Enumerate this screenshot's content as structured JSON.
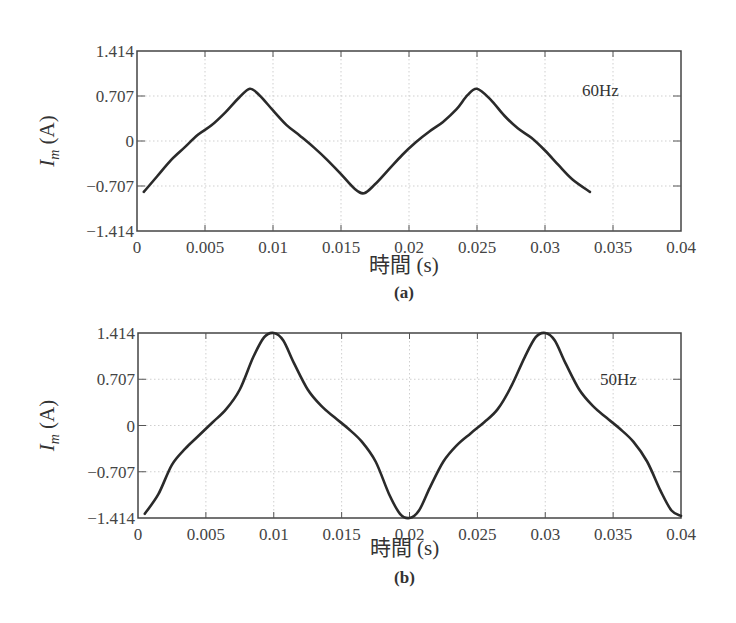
{
  "chart_data": [
    {
      "type": "line",
      "panel": "(a)",
      "annotation": "60Hz",
      "xlabel": "時間 (s)",
      "ylabel": "I_m (A)",
      "xlim": [
        0,
        0.04
      ],
      "ylim": [
        -1.414,
        1.414
      ],
      "xticks": [
        "0",
        "0.005",
        "0.01",
        "0.015",
        "0.02",
        "0.025",
        "0.03",
        "0.035",
        "0.04"
      ],
      "yticks": [
        "1.414",
        "0.707",
        "0",
        "-0.707",
        "-1.414"
      ],
      "grid": true,
      "series": [
        {
          "name": "I_m 60Hz",
          "x": [
            0.0005,
            0.0015,
            0.0025,
            0.0035,
            0.0045,
            0.0055,
            0.0065,
            0.0075,
            0.0083,
            0.009,
            0.01,
            0.011,
            0.012,
            0.013,
            0.014,
            0.015,
            0.016,
            0.0167,
            0.0175,
            0.0185,
            0.0195,
            0.0205,
            0.0215,
            0.0225,
            0.0235,
            0.0243,
            0.025,
            0.026,
            0.027,
            0.028,
            0.029,
            0.03,
            0.031,
            0.032,
            0.0333
          ],
          "y": [
            -0.8,
            -0.55,
            -0.3,
            -0.1,
            0.1,
            0.25,
            0.45,
            0.68,
            0.82,
            0.72,
            0.48,
            0.25,
            0.08,
            -0.1,
            -0.3,
            -0.52,
            -0.75,
            -0.82,
            -0.68,
            -0.45,
            -0.22,
            -0.02,
            0.15,
            0.3,
            0.5,
            0.72,
            0.82,
            0.65,
            0.4,
            0.2,
            0.05,
            -0.15,
            -0.38,
            -0.6,
            -0.8
          ]
        }
      ]
    },
    {
      "type": "line",
      "panel": "(b)",
      "annotation": "50Hz",
      "xlabel": "時間 (s)",
      "ylabel": "I_m (A)",
      "xlim": [
        0,
        0.04
      ],
      "ylim": [
        -1.414,
        1.414
      ],
      "xticks": [
        "0",
        "0.005",
        "0.01",
        "0.015",
        "0.02",
        "0.025",
        "0.03",
        "0.035",
        "0.04"
      ],
      "yticks": [
        "1.414",
        "0.707",
        "0",
        "-0.707",
        "-1.414"
      ],
      "grid": true,
      "series": [
        {
          "name": "I_m 50Hz",
          "x": [
            0.0005,
            0.0015,
            0.0025,
            0.0035,
            0.0045,
            0.0055,
            0.0065,
            0.0075,
            0.0085,
            0.0093,
            0.01,
            0.0107,
            0.0115,
            0.0125,
            0.0135,
            0.0145,
            0.0155,
            0.0165,
            0.0175,
            0.0185,
            0.0193,
            0.02,
            0.0207,
            0.0215,
            0.0225,
            0.0235,
            0.0245,
            0.0255,
            0.0265,
            0.0275,
            0.0285,
            0.0293,
            0.03,
            0.0307,
            0.0315,
            0.0325,
            0.0335,
            0.0345,
            0.0355,
            0.0365,
            0.0375,
            0.0385,
            0.0393,
            0.04
          ],
          "y": [
            -1.35,
            -1.05,
            -0.6,
            -0.35,
            -0.15,
            0.05,
            0.25,
            0.55,
            1.05,
            1.35,
            1.414,
            1.3,
            0.95,
            0.55,
            0.3,
            0.12,
            -0.05,
            -0.25,
            -0.55,
            -1.05,
            -1.35,
            -1.414,
            -1.3,
            -0.95,
            -0.55,
            -0.3,
            -0.12,
            0.05,
            0.25,
            0.6,
            1.05,
            1.35,
            1.414,
            1.3,
            0.95,
            0.55,
            0.3,
            0.12,
            -0.05,
            -0.25,
            -0.55,
            -1.0,
            -1.3,
            -1.38
          ]
        }
      ]
    }
  ],
  "panels": [
    {
      "label": "(a)",
      "annotation": "60Hz",
      "xlabel": "時間 (s)",
      "ylabel_main": "I",
      "ylabel_sub": "m",
      "ylabel_unit": " (A)"
    },
    {
      "label": "(b)",
      "annotation": "50Hz",
      "xlabel": "時間 (s)",
      "ylabel_main": "I",
      "ylabel_sub": "m",
      "ylabel_unit": " (A)"
    }
  ],
  "colors": {
    "curve": "#2a2a2a",
    "axis": "#444444",
    "grid": "#cfcfcf"
  }
}
